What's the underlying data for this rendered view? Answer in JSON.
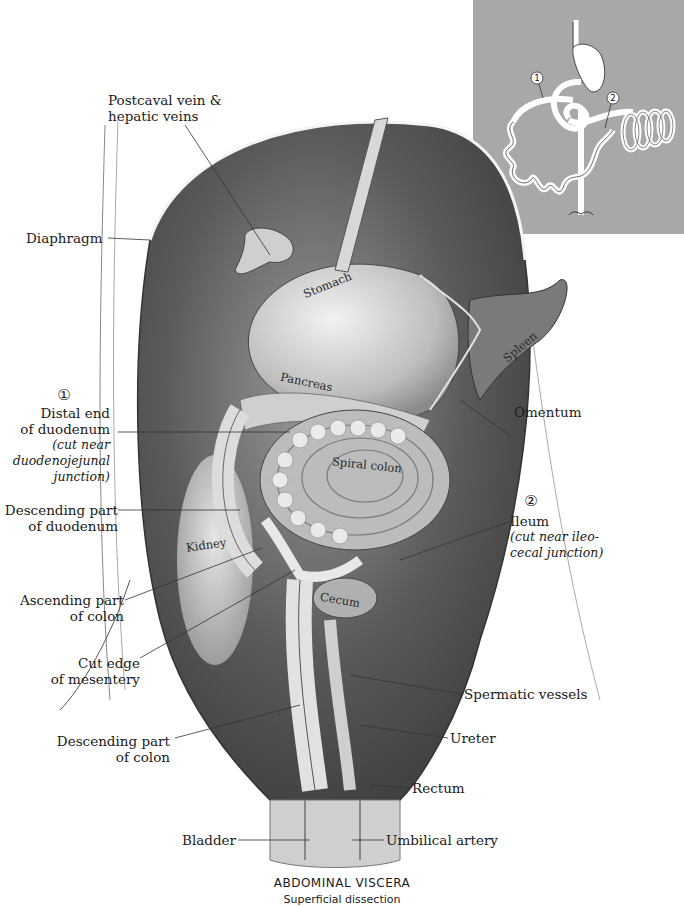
{
  "figure": {
    "title": "ABDOMINAL VISCERA",
    "subtitle": "Superficial dissection"
  },
  "labels": {
    "postcaval": [
      "Postcaval vein &",
      "hepatic veins"
    ],
    "diaphragm": "Diaphragm",
    "distal_duodenum": {
      "marker": "①",
      "lines": [
        "Distal end",
        "of duodenum"
      ],
      "note": [
        "(cut near",
        "duodenojejunal",
        "junction)"
      ]
    },
    "descending_duodenum": [
      "Descending part",
      "of duodenum"
    ],
    "ascending_colon": [
      "Ascending part",
      "of colon"
    ],
    "cut_mesentery": [
      "Cut edge",
      "of mesentery"
    ],
    "descending_colon": [
      "Descending part",
      "of colon"
    ],
    "omentum": "Omentum",
    "ileum": {
      "marker": "②",
      "line": "Ileum",
      "note": [
        "(cut near ileo-",
        "cecal junction)"
      ]
    },
    "spermatic_vessels": "Spermatic vessels",
    "ureter": "Ureter",
    "rectum": "Rectum",
    "bladder": "Bladder",
    "umbilical_artery": "Umbilical artery"
  },
  "organ_labels": {
    "stomach": "Stomach",
    "spleen": "Spleen",
    "pancreas": "Pancreas",
    "spiral_colon": "Spiral colon",
    "kidney": "Kidney",
    "cecum": "Cecum"
  },
  "inset": {
    "markers": [
      "1",
      "2"
    ],
    "background": "#a8a8a8"
  }
}
